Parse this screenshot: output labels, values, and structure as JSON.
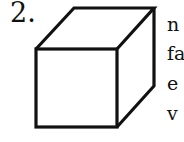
{
  "problem": {
    "number": "2.",
    "figure": "cube-icon",
    "text_fragments": [
      "n",
      "fa",
      "e",
      "v"
    ]
  }
}
